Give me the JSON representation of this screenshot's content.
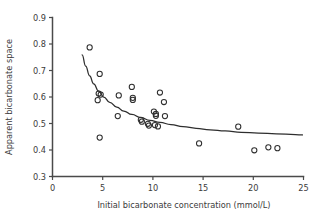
{
  "chart_data": {
    "type": "scatter",
    "title": "",
    "xlabel": "Initial bicarbonate concentration (mmol/L)",
    "ylabel": "Apparent bicarbonate space",
    "xlim": [
      0,
      25
    ],
    "ylim": [
      0.3,
      0.9
    ],
    "xticks": [
      0,
      5,
      10,
      15,
      20,
      25
    ],
    "yticks": [
      0.3,
      0.4,
      0.5,
      0.6,
      0.7,
      0.8,
      0.9
    ],
    "xtick_labels": [
      "0",
      "5",
      "10",
      "15",
      "20",
      "25"
    ],
    "ytick_labels": [
      "0.3",
      "0.4",
      "0.5",
      "0.6",
      "0.7",
      "0.8",
      "0.9"
    ],
    "grid": false,
    "legend": null,
    "marker": "open-circle",
    "marker_color": "#2e2e2e",
    "series": [
      {
        "name": "Observations",
        "points": [
          [
            3.7,
            0.787
          ],
          [
            4.7,
            0.687
          ],
          [
            4.6,
            0.613
          ],
          [
            4.8,
            0.609
          ],
          [
            4.5,
            0.588
          ],
          [
            4.7,
            0.447
          ],
          [
            6.6,
            0.606
          ],
          [
            6.5,
            0.528
          ],
          [
            7.9,
            0.638
          ],
          [
            8.0,
            0.597
          ],
          [
            8.0,
            0.589
          ],
          [
            8.8,
            0.514
          ],
          [
            8.9,
            0.507
          ],
          [
            9.5,
            0.499
          ],
          [
            9.6,
            0.492
          ],
          [
            10.1,
            0.545
          ],
          [
            10.3,
            0.536
          ],
          [
            10.3,
            0.529
          ],
          [
            10.2,
            0.494
          ],
          [
            10.5,
            0.489
          ],
          [
            10.7,
            0.617
          ],
          [
            11.1,
            0.581
          ],
          [
            11.2,
            0.528
          ],
          [
            14.6,
            0.425
          ],
          [
            18.5,
            0.488
          ],
          [
            20.1,
            0.399
          ],
          [
            21.5,
            0.41
          ],
          [
            22.4,
            0.407
          ]
        ]
      }
    ],
    "fit_curve": {
      "name": "Fitted decay curve",
      "points": [
        [
          2.95,
          0.759
        ],
        [
          3.3,
          0.717
        ],
        [
          3.7,
          0.68
        ],
        [
          4.1,
          0.65
        ],
        [
          4.6,
          0.622
        ],
        [
          5.1,
          0.6
        ],
        [
          5.7,
          0.58
        ],
        [
          6.4,
          0.562
        ],
        [
          7.1,
          0.547
        ],
        [
          7.9,
          0.534
        ],
        [
          8.8,
          0.522
        ],
        [
          9.7,
          0.512
        ],
        [
          10.7,
          0.504
        ],
        [
          11.8,
          0.496
        ],
        [
          13.0,
          0.488
        ],
        [
          14.3,
          0.482
        ],
        [
          15.7,
          0.476
        ],
        [
          17.2,
          0.472
        ],
        [
          18.8,
          0.467
        ],
        [
          20.5,
          0.464
        ],
        [
          22.3,
          0.461
        ],
        [
          24.2,
          0.458
        ],
        [
          24.9,
          0.457
        ]
      ]
    }
  },
  "axes": {
    "x_title": "Initial bicarbonate concentration (mmol/L)",
    "y_title": "Apparent bicarbonate space"
  }
}
